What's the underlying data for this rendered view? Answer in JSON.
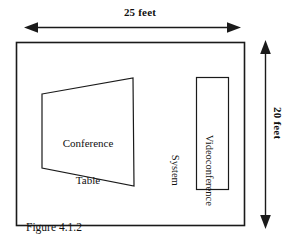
{
  "figure": {
    "caption_line1": "Figure 4.1.2",
    "caption_line2": "A Typical Corporate Conference Room",
    "stroke_color": "#1a1a1a",
    "background_color": "#ffffff"
  },
  "dimensions": {
    "width_label": "25 feet",
    "height_label": "20 feet",
    "width_value": 25,
    "height_value": 20,
    "unit": "feet"
  },
  "room": {
    "name": "Conference Room"
  },
  "objects": {
    "table": {
      "line1": "Conference",
      "line2": "Table",
      "shape": "trapezoid"
    },
    "videoconference": {
      "line1": "Videoconference",
      "line2": "System",
      "shape": "rectangle"
    }
  }
}
